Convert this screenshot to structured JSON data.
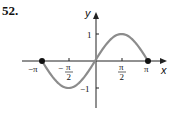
{
  "problem_number": "52.",
  "chart_data": {
    "type": "line",
    "title": "",
    "function": "y = sin(x)",
    "xlabel": "x",
    "ylabel": "y",
    "x_ticks": [
      "-π",
      "-π/2",
      "π/2",
      "π"
    ],
    "y_ticks": [
      "1",
      "-1"
    ],
    "xlim": [
      -3.14159,
      3.14159
    ],
    "ylim": [
      -1,
      1
    ],
    "x": [
      -3.14159,
      -2.35619,
      -1.5708,
      -0.7854,
      0,
      0.7854,
      1.5708,
      2.35619,
      3.14159
    ],
    "values": [
      0,
      -0.707,
      -1,
      -0.707,
      0,
      0.707,
      1,
      0.707,
      0
    ],
    "endpoints": [
      [
        -3.14159,
        0
      ],
      [
        3.14159,
        0
      ]
    ],
    "grid": false,
    "colors": {
      "curve": "#8c8c8c",
      "axes": "#222222",
      "endpoints": "#111111"
    }
  }
}
